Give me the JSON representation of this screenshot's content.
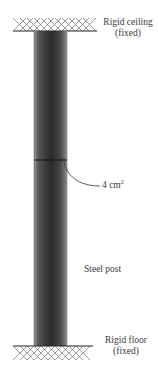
{
  "labels": {
    "ceiling_line1": "Rigid ceiling",
    "ceiling_line2": "(fixed)",
    "floor_line1": "Rigid floor",
    "floor_line2": "(fixed)",
    "area_value": "4 cm",
    "area_exp": "2",
    "post": "Steel post"
  },
  "colors": {
    "post_dark": "#2a2a2a",
    "post_light": "#8a8a8a",
    "line": "#222222"
  }
}
